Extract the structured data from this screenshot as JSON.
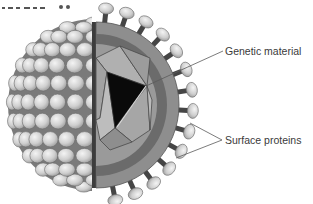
{
  "figure": {
    "colors": {
      "background": "#ffffff",
      "protein_head": "#d0d0d0",
      "protein_head_highlight": "#f0f0f0",
      "protein_stalk": "#4a4a4a",
      "envelope": "#8a8a8a",
      "inner_shell": "#6a6a6a",
      "capsid_light": "#a8a8a8",
      "capsid_mid": "#8c8c8c",
      "genetic_core": "#0a0a0a",
      "leader_line": "#5a5a5a"
    }
  },
  "labels": {
    "genetic_material": "Genetic material",
    "surface_proteins": "Surface proteins"
  }
}
